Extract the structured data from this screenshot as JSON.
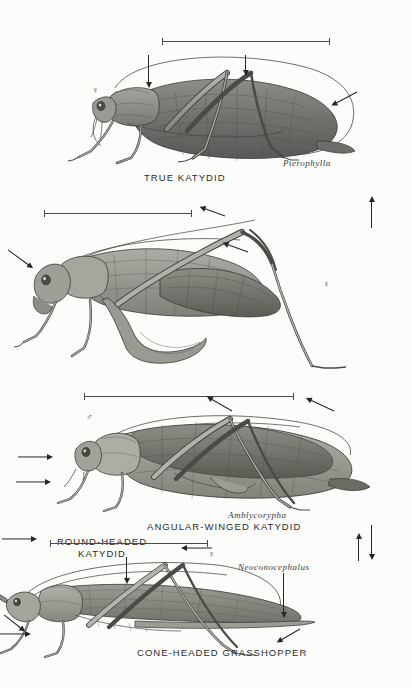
{
  "plate": {
    "title": "Katydids and cone-headed grasshoppers",
    "background_color": "#fcfcfa",
    "ink_color": "#2b2b2b"
  },
  "panels": [
    {
      "id": "true-katydid",
      "caption": "TRUE KATYDID",
      "genus": "Pterophylla",
      "sex_symbol": "♀",
      "sex": "female",
      "scale_bar": true,
      "arrow_count": 4
    },
    {
      "id": "round-headed-katydid",
      "caption": "ROUND-HEADED KATYDID",
      "genus": "Amblycorypha",
      "sex_symbol": "♀",
      "sex": "female",
      "scale_bar": true,
      "arrow_count": 6
    },
    {
      "id": "angular-winged-katydid",
      "caption": "ANGULAR-WINGED KATYDID",
      "genus": "",
      "sex_symbol": "♂",
      "sex": "male",
      "scale_bar": true,
      "arrow_count": 5
    },
    {
      "id": "cone-headed-grasshopper",
      "caption": "CONE-HEADED GRASSHOPPER",
      "genus": "Neoconocephalus",
      "sex_symbol": "♀",
      "sex": "female",
      "scale_bar": true,
      "arrow_count": 4
    }
  ]
}
